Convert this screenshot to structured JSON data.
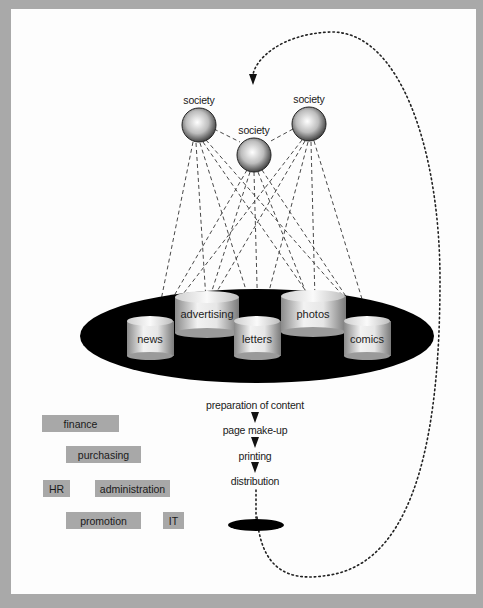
{
  "diagram": {
    "societies": [
      {
        "label": "society",
        "position": "left"
      },
      {
        "label": "society",
        "position": "center"
      },
      {
        "label": "society",
        "position": "right"
      }
    ],
    "content_sections": [
      {
        "label": "news"
      },
      {
        "label": "advertising"
      },
      {
        "label": "letters"
      },
      {
        "label": "photos"
      },
      {
        "label": "comics"
      }
    ],
    "process_steps": [
      {
        "label": "preparation of content"
      },
      {
        "label": "page make-up"
      },
      {
        "label": "printing"
      },
      {
        "label": "distribution"
      }
    ],
    "departments": [
      {
        "label": "finance"
      },
      {
        "label": "purchasing"
      },
      {
        "label": "HR"
      },
      {
        "label": "administration"
      },
      {
        "label": "promotion"
      },
      {
        "label": "IT"
      }
    ],
    "colors": {
      "background": "#a9a9a9",
      "page": "#fdfdfd",
      "platform": "#000000",
      "department_box": "#a8a8a8",
      "text": "#1a1a1a"
    }
  }
}
